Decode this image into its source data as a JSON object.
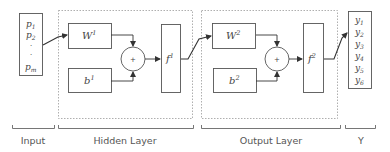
{
  "diagram": {
    "type": "neural-network-block-diagram",
    "colors": {
      "stroke": "#555555",
      "dashed": "#9a9a9a",
      "text": "#444444",
      "label": "#555555"
    },
    "input": {
      "items": [
        "p",
        "p",
        "·",
        "·",
        "p"
      ],
      "subs": [
        "1",
        "2",
        "",
        "",
        "m"
      ]
    },
    "hidden_layer": {
      "weight": {
        "base": "W",
        "sup": "1"
      },
      "bias": {
        "base": "b",
        "sup": "1"
      },
      "sum": "+",
      "activation": {
        "base": "f",
        "sup": "1"
      }
    },
    "output_layer": {
      "weight": {
        "base": "W",
        "sup": "2"
      },
      "bias": {
        "base": "b",
        "sup": "2"
      },
      "sum": "+",
      "activation": {
        "base": "f",
        "sup": "2"
      }
    },
    "output": {
      "items": [
        "y",
        "y",
        "y",
        "y",
        "y",
        "y"
      ],
      "subs": [
        "1",
        "2",
        "3",
        "4",
        "5",
        "6"
      ]
    },
    "section_labels": {
      "input": "Input",
      "hidden": "Hidden Layer",
      "output": "Output Layer",
      "y": "Y"
    }
  }
}
